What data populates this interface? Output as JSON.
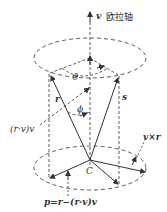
{
  "diagram": {
    "axis_label": "欧拉轴",
    "axis_symbol": "v",
    "angle_theta": "ϑ",
    "angle_phi": "ϕ",
    "vector_r": "r",
    "vector_s": "s",
    "projection_label": "(r·v)v",
    "center_label": "C",
    "cross_label": "v×r",
    "perp_label": "p=r−(r·v)v",
    "colors": {
      "line": "#333333",
      "background": "#ffffff"
    }
  }
}
